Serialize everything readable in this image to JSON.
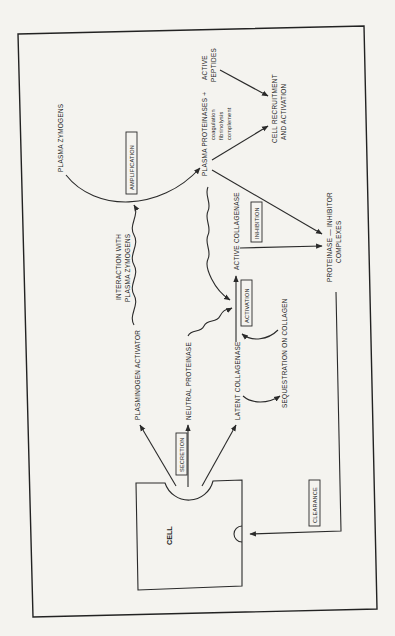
{
  "diagram": {
    "orientation": "rotated -90 degrees (text reads bottom-to-top)",
    "nodes": {
      "cell": "CELL",
      "plasma_zymogens": "PLASMA ZYMOGENS",
      "plasma_proteinases": "PLASMA PROTEINASES +",
      "active_peptides_line1": "ACTIVE",
      "active_peptides_line2": "PEPTIDES",
      "proteinase_sub1": "coagulation",
      "proteinase_sub2": "fibrinolysis",
      "proteinase_sub3": "complement",
      "cell_recruitment_line1": "CELL RECRUITMENT",
      "cell_recruitment_line2": "AND ACTIVATION",
      "interaction_line1": "INTERACTION WITH",
      "interaction_line2": "PLASMA ZYMOGENS",
      "plasminogen_activator": "PLASMINOGEN ACTIVATOR",
      "neutral_proteinase": "NEUTRAL PROTEINASE",
      "latent_collagenase": "LATENT COLLAGENASE",
      "active_collagenase": "ACTIVE COLLAGENASE",
      "sequestration": "SEQUESTRATION ON COLLAGEN",
      "complexes_line1": "PROTEINASE — INHIBITOR",
      "complexes_line2": "COMPLEXES"
    },
    "process_boxes": {
      "amplification": "AMPLIFICATION",
      "activation": "ACTIVATION",
      "inhibition": "INHIBITION",
      "secretion": "SECRETION",
      "clearance": "CLEARANCE"
    },
    "colors": {
      "ink": "#2a2a2a",
      "paper": "#f4f3ef"
    }
  }
}
